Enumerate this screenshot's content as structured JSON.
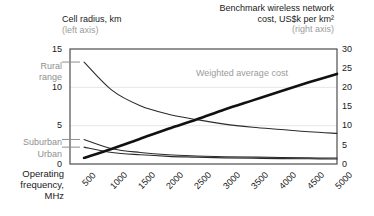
{
  "titles": {
    "left_axis_title": "Cell radius, km",
    "left_axis_sub": "(left axis)",
    "right_axis_title_line1": "Benchmark wireless network",
    "right_axis_title_line2": "cost, US$k per km²",
    "right_axis_sub": "(right axis)"
  },
  "xaxis": {
    "title_line1": "Operating",
    "title_line2": "frequency,",
    "title_line3": "MHz",
    "ticks": [
      "500",
      "1000",
      "1500",
      "2000",
      "2500",
      "3000",
      "3500",
      "4000",
      "4500",
      "5000"
    ]
  },
  "left_axis": {
    "ticks": [
      "15",
      "10",
      "5",
      "0"
    ]
  },
  "right_axis": {
    "ticks": [
      "30",
      "25",
      "20",
      "15",
      "10",
      "5",
      "0"
    ]
  },
  "annotations": {
    "rural_line1": "Rural",
    "rural_line2": "range",
    "suburban": "Suburban",
    "urban": "Urban",
    "weighted_average_cost": "Weighted average cost"
  },
  "colors": {
    "text": "#1a1a1a",
    "muted": "#8f8f8f",
    "line": "#2b2b2b",
    "thick_line": "#111111",
    "grid": "#e6e6e6",
    "frame": "#4d4d4d"
  },
  "chart_data": {
    "type": "line",
    "xlabel": "Operating frequency, MHz",
    "ylabel": "Cell radius, km",
    "y2label": "Benchmark wireless network cost, US$k per km²",
    "xlim": [
      250,
      5000
    ],
    "ylim": [
      0,
      15
    ],
    "y2lim": [
      0,
      30
    ],
    "grid": true,
    "grid_values_left": [
      5,
      10
    ],
    "legend": "inline-annotations",
    "x": [
      500,
      1000,
      1500,
      2000,
      2500,
      3000,
      3500,
      4000,
      4500,
      5000
    ],
    "series": [
      {
        "name": "Rural range",
        "axis": "left",
        "unit": "km",
        "style": "thin",
        "values": [
          13.3,
          9.6,
          7.6,
          6.5,
          5.8,
          5.2,
          4.8,
          4.5,
          4.2,
          4.0
        ]
      },
      {
        "name": "Suburban",
        "axis": "left",
        "unit": "km",
        "style": "thin",
        "values": [
          3.2,
          2.0,
          1.5,
          1.2,
          1.05,
          0.95,
          0.9,
          0.85,
          0.8,
          0.78
        ]
      },
      {
        "name": "Urban",
        "axis": "left",
        "unit": "km",
        "style": "thin",
        "values": [
          2.2,
          1.5,
          1.2,
          1.0,
          0.9,
          0.8,
          0.75,
          0.7,
          0.68,
          0.65
        ]
      },
      {
        "name": "Weighted average cost",
        "axis": "right",
        "unit": "US$k per km²",
        "style": "thick",
        "values": [
          1.6,
          4.0,
          6.6,
          9.2,
          11.6,
          14.2,
          16.6,
          19.0,
          21.3,
          23.5
        ]
      }
    ],
    "axis_markers_left": [
      {
        "label": "Rural range",
        "value": 13.3
      },
      {
        "label": "Suburban",
        "value": 3.2
      },
      {
        "label": "Urban",
        "value": 2.2
      }
    ]
  }
}
